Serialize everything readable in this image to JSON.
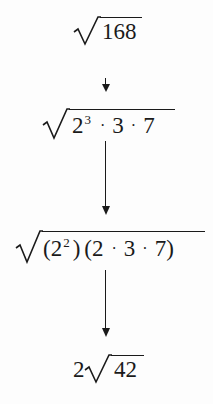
{
  "diagram": {
    "steps": [
      {
        "id": "step1",
        "radicand": "168",
        "coefficient": ""
      },
      {
        "id": "step2",
        "radicand_parts": {
          "base": "2",
          "exp": "3",
          "dot1": "·",
          "f2": "3",
          "dot2": "·",
          "f3": "7"
        }
      },
      {
        "id": "step3",
        "radicand_parts": {
          "lp1": "(",
          "base": "2",
          "exp": "2",
          "rp1": ")",
          "lp2": "(",
          "f1": "2",
          "dot1": "·",
          "f2": "3",
          "dot2": "·",
          "f3": "7",
          "rp2": ")"
        }
      },
      {
        "id": "step4",
        "coefficient": "2",
        "radicand": "42"
      }
    ],
    "arrows": [
      {
        "from": "step1",
        "to": "step2",
        "glyph": "↓"
      },
      {
        "from": "step2",
        "to": "step3",
        "style": "long"
      },
      {
        "from": "step3",
        "to": "step4",
        "style": "long"
      }
    ],
    "colors": {
      "ink": "#1a1a1a",
      "background": "#fdfdfd"
    }
  }
}
